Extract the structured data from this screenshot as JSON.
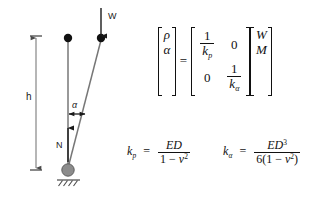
{
  "figure": {
    "colors": {
      "line": "#6f6f6f",
      "node": "#111111",
      "pivot_fill": "#8c8c8c",
      "text": "#1a1a1a",
      "math": "#111111",
      "background": "#ffffff"
    },
    "diagram": {
      "labels": {
        "height": "h",
        "load": "W",
        "normal_force": "N",
        "angle": "α"
      },
      "elements": {
        "dimension_line": "h-dimension-line",
        "vertical_rod": "vertical-reference-rod",
        "inclined_rod": "inclined-deformed-rod",
        "top_node_vertical": "vertical-rod-top-node",
        "top_node_inclined": "inclined-rod-top-node",
        "pivot": "ground-pivot-node",
        "ground": "hatched-ground-support",
        "load_arrow": "w-load-arrow",
        "normal_arrow": "n-normal-force-arrow",
        "angle_arrow": "alpha-angle-double-arrow"
      }
    },
    "matrix_equation": {
      "lhs": {
        "rows": [
          "ρ",
          "α"
        ]
      },
      "equals": "=",
      "matrix": {
        "r0c0_num": "1",
        "r0c0_den_base": "k",
        "r0c0_den_sub": "p",
        "r0c1": "0",
        "r1c0": "0",
        "r1c1_num": "1",
        "r1c1_den_base": "k",
        "r1c1_den_sub": "α"
      },
      "rhs": {
        "rows": [
          "W",
          "M"
        ]
      }
    },
    "formulas": [
      {
        "name": "kp",
        "lhs_base": "k",
        "lhs_sub": "p",
        "equals": "=",
        "numerator": "ED",
        "denominator_pre": "1 − ",
        "denominator_var": "v",
        "denominator_sup": "2"
      },
      {
        "name": "kalpha",
        "lhs_base": "k",
        "lhs_sub": "α",
        "equals": "=",
        "numerator_base": "ED",
        "numerator_sup": "3",
        "denominator_pre": "6(1 − ",
        "denominator_var": "v",
        "denominator_sup": "2",
        "denominator_post": ")"
      }
    ]
  }
}
